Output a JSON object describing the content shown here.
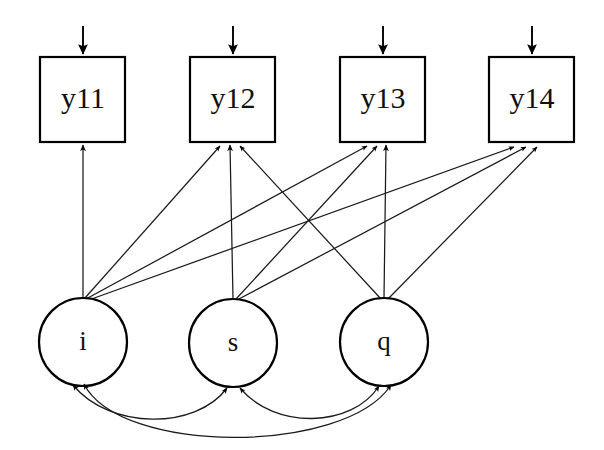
{
  "diagram": {
    "type": "sem-path-diagram",
    "title": "",
    "background_color": "#ffffff",
    "line_color": "#1a1a1a",
    "observed": [
      {
        "id": "y11",
        "label": "y11",
        "shape": "rectangle",
        "x": 40,
        "y": 57,
        "w": 85,
        "h": 85,
        "cx": 83,
        "cy": 99
      },
      {
        "id": "y12",
        "label": "y12",
        "shape": "rectangle",
        "x": 190,
        "y": 57,
        "w": 85,
        "h": 85,
        "cx": 233,
        "cy": 99
      },
      {
        "id": "y13",
        "label": "y13",
        "shape": "rectangle",
        "x": 340,
        "y": 57,
        "w": 85,
        "h": 85,
        "cx": 383,
        "cy": 99
      },
      {
        "id": "y14",
        "label": "y14",
        "shape": "rectangle",
        "x": 489,
        "y": 57,
        "w": 85,
        "h": 85,
        "cx": 532,
        "cy": 99
      }
    ],
    "latent": [
      {
        "id": "i",
        "label": "i",
        "shape": "circle",
        "cx": 83,
        "cy": 342,
        "rx": 44,
        "ry": 44
      },
      {
        "id": "s",
        "label": "s",
        "shape": "circle",
        "cx": 233,
        "cy": 343,
        "rx": 44,
        "ry": 44
      },
      {
        "id": "q",
        "label": "q",
        "shape": "circle",
        "cx": 384,
        "cy": 342,
        "rx": 44,
        "ry": 44
      }
    ],
    "loadings": [
      {
        "from": "i",
        "to": "y11",
        "arrow": "single"
      },
      {
        "from": "i",
        "to": "y12",
        "arrow": "single"
      },
      {
        "from": "i",
        "to": "y13",
        "arrow": "single"
      },
      {
        "from": "i",
        "to": "y14",
        "arrow": "single"
      },
      {
        "from": "s",
        "to": "y12",
        "arrow": "single"
      },
      {
        "from": "s",
        "to": "y13",
        "arrow": "single"
      },
      {
        "from": "s",
        "to": "y14",
        "arrow": "single"
      },
      {
        "from": "q",
        "to": "y12",
        "arrow": "single"
      },
      {
        "from": "q",
        "to": "y13",
        "arrow": "single"
      },
      {
        "from": "q",
        "to": "y14",
        "arrow": "single"
      }
    ],
    "residuals": [
      {
        "to": "y11",
        "arrow": "single"
      },
      {
        "to": "y12",
        "arrow": "single"
      },
      {
        "to": "y13",
        "arrow": "single"
      },
      {
        "to": "y14",
        "arrow": "single"
      }
    ],
    "covariances": [
      {
        "between": [
          "i",
          "s"
        ],
        "arrow": "double"
      },
      {
        "between": [
          "s",
          "q"
        ],
        "arrow": "double"
      },
      {
        "between": [
          "i",
          "q"
        ],
        "arrow": "double"
      }
    ]
  }
}
